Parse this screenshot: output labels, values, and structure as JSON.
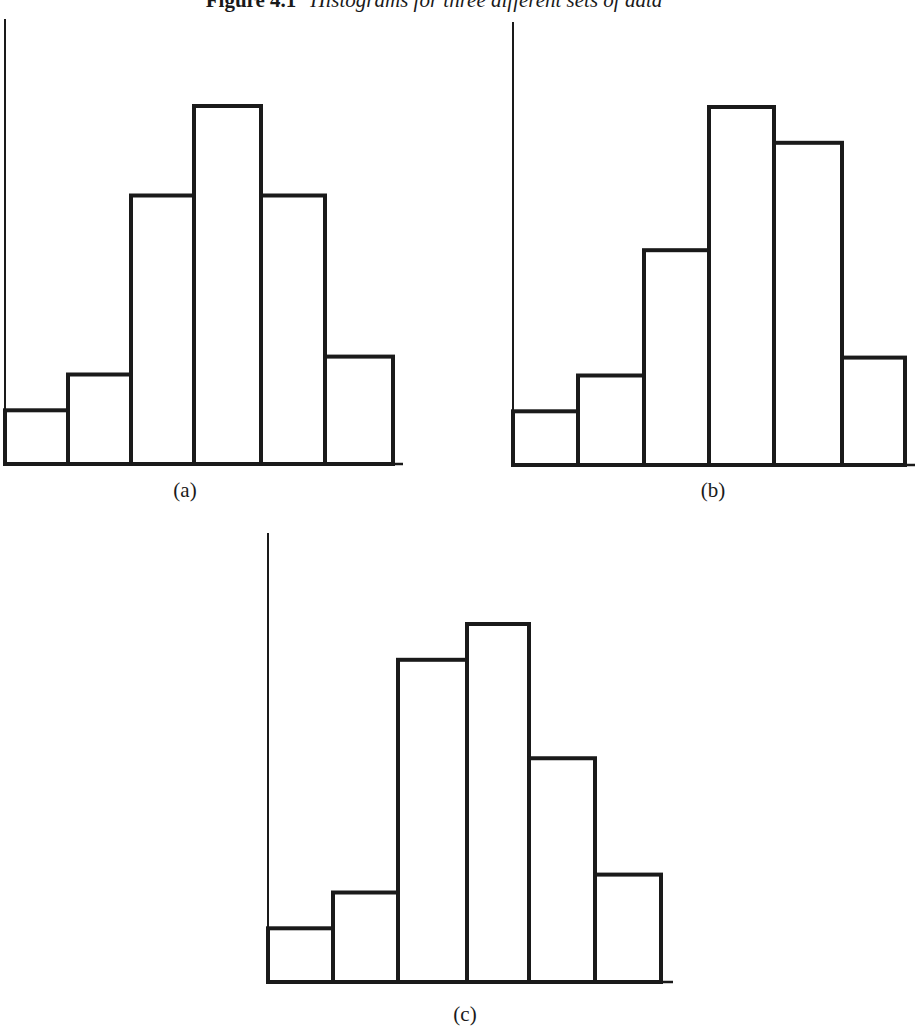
{
  "figure": {
    "number": "Figure 4.1",
    "caption": "Histograms for three different sets of data"
  },
  "style": {
    "stroke": "#1a1a1a",
    "background": "#ffffff"
  },
  "chart_data": [
    {
      "type": "bar",
      "panel": "(a)",
      "title": "",
      "xlabel": "",
      "ylabel": "",
      "categories": [
        "1",
        "2",
        "3",
        "4",
        "5",
        "6"
      ],
      "values": [
        3,
        5,
        15,
        20,
        15,
        6
      ],
      "ylim": [
        0,
        25
      ],
      "grid": false,
      "tick_labels": false,
      "legend": null,
      "note": "Relative bar heights (no axis ticks shown); symmetric distribution"
    },
    {
      "type": "bar",
      "panel": "(b)",
      "title": "",
      "xlabel": "",
      "ylabel": "",
      "categories": [
        "1",
        "2",
        "3",
        "4",
        "5",
        "6"
      ],
      "values": [
        3,
        5,
        12,
        20,
        18,
        6
      ],
      "ylim": [
        0,
        25
      ],
      "grid": false,
      "tick_labels": false,
      "legend": null,
      "note": "Relative bar heights (no axis ticks shown)"
    },
    {
      "type": "bar",
      "panel": "(c)",
      "title": "",
      "xlabel": "",
      "ylabel": "",
      "categories": [
        "1",
        "2",
        "3",
        "4",
        "5",
        "6"
      ],
      "values": [
        3,
        5,
        18,
        20,
        12.5,
        6
      ],
      "ylim": [
        0,
        25
      ],
      "grid": false,
      "tick_labels": false,
      "legend": null,
      "note": "Relative bar heights (no axis ticks shown)"
    }
  ],
  "layout": {
    "unit_px": 17.9,
    "panels": [
      {
        "axis_x": 5,
        "axis_top": 19,
        "baseline_y": 464,
        "baseline_end": 403,
        "edges": [
          5,
          68,
          131,
          194,
          261,
          325,
          393
        ],
        "label_x": 185,
        "label_y": 478
      },
      {
        "axis_x": 513,
        "axis_top": 22,
        "baseline_y": 465,
        "baseline_end": 915,
        "edges": [
          513,
          578,
          644,
          709,
          774,
          842,
          905
        ],
        "label_x": 713,
        "label_y": 478
      },
      {
        "axis_x": 268,
        "axis_top": 533,
        "baseline_y": 982,
        "baseline_end": 673,
        "edges": [
          268,
          333,
          398,
          467,
          529,
          595,
          661
        ],
        "label_x": 465,
        "label_y": 1002
      }
    ]
  }
}
